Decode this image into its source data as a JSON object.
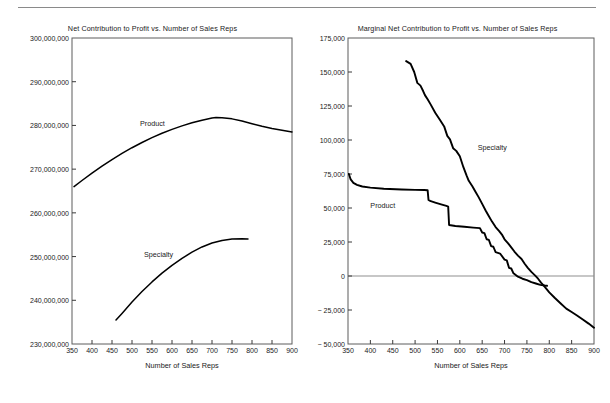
{
  "figure": {
    "rule": "horizontal-rule",
    "panels": [
      "left",
      "right"
    ]
  },
  "charts": [
    {
      "id": "net-contribution",
      "title": "Net Contribution to Profit vs. Number of Sales Reps",
      "xlabel": "Number of Sales Reps",
      "ylabel": "",
      "xticks": [
        "350",
        "400",
        "450",
        "500",
        "550",
        "600",
        "650",
        "700",
        "750",
        "800",
        "850",
        "900"
      ],
      "yticks": [
        "300,000,000",
        "290,000,000",
        "280,000,000",
        "270,000,000",
        "260,000,000",
        "250,000,000",
        "240,000,000",
        "230,000,000"
      ],
      "series_labels": [
        {
          "name": "Product",
          "x": 520,
          "y": 280500000
        },
        {
          "name": "Specialty",
          "x": 530,
          "y": 250700000
        }
      ]
    },
    {
      "id": "marginal-net-contribution",
      "title": "Marginal Net Contribution to Profit vs. Number of Sales Reps",
      "xlabel": "Number of Sales Reps",
      "ylabel": "",
      "xticks": [
        "350",
        "400",
        "450",
        "500",
        "550",
        "600",
        "650",
        "700",
        "750",
        "800",
        "850",
        "900"
      ],
      "yticks": [
        "175,000",
        "150,000",
        "125,000",
        "100,000",
        "75,000",
        "50,000",
        "25,000",
        "0",
        "− 25,000",
        "− 50,000"
      ],
      "series_labels": [
        {
          "name": "Specialty",
          "x": 640,
          "y": 95000
        },
        {
          "name": "Product",
          "x": 400,
          "y": 52000
        }
      ]
    }
  ],
  "chart_data": [
    {
      "type": "line",
      "id": "net-contribution",
      "title": "Net Contribution to Profit vs. Number of Sales Reps",
      "xlabel": "Number of Sales Reps",
      "ylabel": "",
      "xlim": [
        350,
        900
      ],
      "ylim": [
        230000000,
        300000000
      ],
      "xticks": [
        350,
        400,
        450,
        500,
        550,
        600,
        650,
        700,
        750,
        800,
        850,
        900
      ],
      "yticks": [
        230000000,
        240000000,
        250000000,
        260000000,
        270000000,
        280000000,
        290000000,
        300000000
      ],
      "grid": false,
      "legend": "inline-labels",
      "series": [
        {
          "name": "Product",
          "x": [
            355,
            375,
            400,
            425,
            450,
            475,
            500,
            525,
            550,
            575,
            600,
            625,
            650,
            675,
            700,
            710,
            725,
            750,
            775,
            800,
            825,
            850,
            875,
            900
          ],
          "values": [
            266000000,
            267400000,
            269100000,
            270700000,
            272200000,
            273600000,
            274900000,
            276100000,
            277200000,
            278200000,
            279100000,
            279900000,
            280600000,
            281200000,
            281700000,
            281800000,
            281750000,
            281500000,
            281000000,
            280400000,
            279800000,
            279300000,
            278900000,
            278500000
          ]
        },
        {
          "name": "Specialty",
          "x": [
            460,
            475,
            500,
            525,
            550,
            575,
            600,
            625,
            650,
            675,
            700,
            725,
            750,
            775,
            790
          ],
          "values": [
            235500000,
            237000000,
            239600000,
            242000000,
            244200000,
            246200000,
            248000000,
            249600000,
            251000000,
            252200000,
            253100000,
            253700000,
            254000000,
            254050000,
            254000000
          ]
        }
      ]
    },
    {
      "type": "line",
      "id": "marginal-net-contribution",
      "title": "Marginal Net Contribution to Profit vs. Number of Sales Reps",
      "xlabel": "Number of Sales Reps",
      "ylabel": "",
      "xlim": [
        350,
        900
      ],
      "ylim": [
        -50000,
        175000
      ],
      "xticks": [
        350,
        400,
        450,
        500,
        550,
        600,
        650,
        700,
        750,
        800,
        850,
        900
      ],
      "yticks": [
        -50000,
        -25000,
        0,
        25000,
        50000,
        75000,
        100000,
        125000,
        150000,
        175000
      ],
      "grid": false,
      "zero_line": true,
      "legend": "inline-labels",
      "series": [
        {
          "name": "Product",
          "x": [
            352,
            356,
            362,
            370,
            382,
            400,
            430,
            470,
            500,
            520,
            528,
            530,
            535,
            545,
            560,
            570,
            574,
            576,
            590,
            610,
            630,
            645,
            650,
            655,
            660,
            665,
            670,
            675,
            680,
            690,
            700,
            705,
            710,
            715,
            720,
            730,
            740,
            750,
            760,
            770,
            780,
            790,
            795
          ],
          "values": [
            75000,
            71000,
            68500,
            67000,
            65800,
            65000,
            64200,
            63600,
            63300,
            63200,
            63100,
            56000,
            55000,
            54000,
            52500,
            51500,
            51000,
            37500,
            36800,
            36200,
            35600,
            35200,
            32000,
            31500,
            27000,
            26500,
            22000,
            21500,
            17500,
            16500,
            12000,
            11500,
            6000,
            5500,
            2000,
            -500,
            -2000,
            -3000,
            -4500,
            -5500,
            -6500,
            -7000,
            -7200
          ]
        },
        {
          "name": "Specialty",
          "x": [
            480,
            490,
            498,
            505,
            512,
            518,
            522,
            528,
            535,
            545,
            555,
            565,
            572,
            578,
            585,
            592,
            600,
            608,
            615,
            620,
            628,
            635,
            642,
            650,
            658,
            665,
            672,
            680,
            688,
            695,
            700,
            708,
            715,
            722,
            730,
            738,
            745,
            752,
            760,
            768,
            775,
            782,
            790,
            800,
            812,
            825,
            838,
            850,
            862,
            875,
            888,
            900
          ],
          "values": [
            158000,
            156000,
            150000,
            142000,
            140000,
            136000,
            133000,
            130000,
            126000,
            120000,
            115000,
            110000,
            103000,
            100500,
            94000,
            92000,
            88000,
            80000,
            74000,
            70000,
            66000,
            62000,
            58000,
            53000,
            48000,
            44000,
            40000,
            36000,
            33000,
            30000,
            27000,
            24000,
            21000,
            18000,
            15000,
            12500,
            9000,
            6000,
            3000,
            500,
            -2000,
            -5000,
            -8000,
            -12000,
            -16000,
            -20000,
            -24000,
            -26500,
            -29000,
            -32000,
            -35000,
            -38000
          ]
        }
      ]
    }
  ]
}
